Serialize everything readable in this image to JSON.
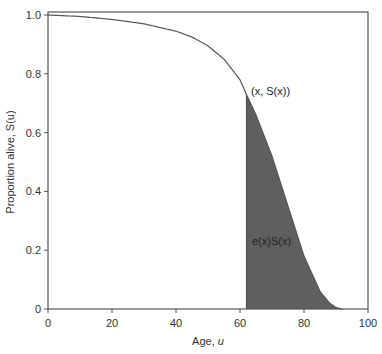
{
  "chart_data": {
    "type": "area",
    "title": "",
    "xlabel": "Age, u",
    "ylabel": "Proportion alive, S(u)",
    "xlim": [
      0,
      100
    ],
    "ylim": [
      0,
      1.0
    ],
    "xticks": [
      "0",
      "20",
      "40",
      "60",
      "80",
      "100"
    ],
    "yticks": [
      "0",
      "0.2",
      "0.4",
      "0.6",
      "0.8",
      "1.0"
    ],
    "grid": false,
    "legend": null,
    "series": [
      {
        "name": "S(u) survival curve",
        "x": [
          0,
          10,
          20,
          30,
          40,
          45,
          50,
          55,
          60,
          62,
          65,
          70,
          75,
          80,
          85,
          88,
          90,
          92
        ],
        "y": [
          1.0,
          0.995,
          0.985,
          0.97,
          0.945,
          0.925,
          0.895,
          0.85,
          0.78,
          0.73,
          0.66,
          0.52,
          0.35,
          0.18,
          0.06,
          0.02,
          0.005,
          0.0
        ]
      }
    ],
    "shaded_region": {
      "from_x": 62,
      "to_x": 92,
      "label": "e(x)S(x)"
    },
    "annotations": [
      {
        "text": "(x, S(x))",
        "x": 62,
        "y": 0.73
      },
      {
        "text": "e(x)S(x)",
        "x": 72,
        "y": 0.28
      }
    ],
    "colors": {
      "curve": "#555555",
      "shade": "#5f5f5f",
      "axis": "#444444"
    }
  },
  "labels": {
    "xlabel_prefix": "Age, ",
    "xlabel_var": "u",
    "ylabel_prefix": "Proportion alive, ",
    "ylabel_var": "S(u)",
    "point_annotation": "(x, S(x))",
    "area_annotation": "e(x)S(x)"
  }
}
